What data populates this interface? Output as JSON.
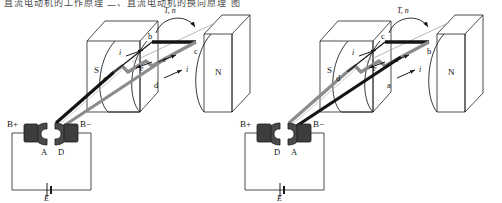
{
  "page": {
    "header_text": "直流电动机的工作原理  二、直流电动机的换向原理  图",
    "figure_type": "dc-motor-commutation-diagram",
    "panel_count": 2
  },
  "colors": {
    "line": "#1a1a1a",
    "coil_dark": "#141414",
    "coil_gray": "#8c8c8c",
    "brush_fill": "#3d3d3d",
    "commutator_fill": "#4a4a4a",
    "magnet_stroke": "#222222",
    "background": "#ffffff"
  },
  "panels": [
    {
      "id": "left",
      "name": "position-one",
      "poles": {
        "left": "S",
        "right": "N"
      },
      "rotation_label": "T, n",
      "coil_nodes": {
        "top_left": "b",
        "top_right": "c",
        "bottom_left": "a",
        "bottom_right": "d"
      },
      "current_labels": [
        "i",
        "i"
      ],
      "emf_labels": [
        "e",
        "e"
      ],
      "brushes": {
        "positive": "B+",
        "negative": "B−"
      },
      "commutator_segments": {
        "left": "A",
        "right": "D"
      },
      "source_label": "E"
    },
    {
      "id": "right",
      "name": "position-two",
      "poles": {
        "left": "S",
        "right": "N"
      },
      "rotation_label": "T, n",
      "coil_nodes": {
        "top_left": "c",
        "top_right": "b",
        "bottom_left": "d",
        "bottom_right": "a"
      },
      "current_labels": [
        "i",
        "i"
      ],
      "emf_labels": [
        "e",
        "e"
      ],
      "brushes": {
        "positive": "B+",
        "negative": "B−"
      },
      "commutator_segments": {
        "left": "D",
        "right": "A"
      },
      "source_label": "E"
    }
  ]
}
